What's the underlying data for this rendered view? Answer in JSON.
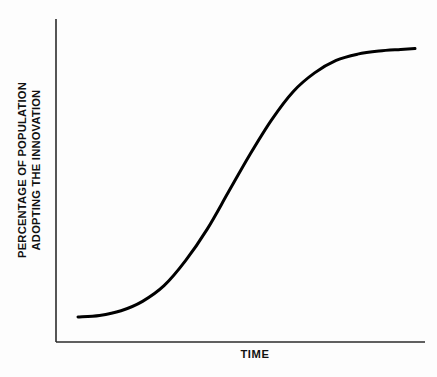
{
  "chart_data": {
    "type": "line",
    "title": "",
    "subtitle": "",
    "xlabel": "TIME",
    "ylabel_line1": "PERCENTAGE OF POPULATION",
    "ylabel_line2": "ADOPTING THE INNOVATION",
    "ylabel": "PERCENTAGE OF POPULATION ADOPTING THE INNOVATION",
    "grid": false,
    "legend": null,
    "legend_position": "none",
    "xlim": [
      0,
      100
    ],
    "ylim": [
      0,
      100
    ],
    "x_tick_labels": [],
    "y_tick_labels": [],
    "annotations": [],
    "series": [
      {
        "name": "Cumulative adoption (S-curve)",
        "color": "#000000",
        "line_width": 3,
        "x": [
          6,
          12,
          18,
          24,
          30,
          36,
          42,
          48,
          54,
          60,
          66,
          72,
          78,
          84,
          90,
          96,
          100
        ],
        "y": [
          8,
          8.5,
          10,
          13,
          18,
          26,
          36,
          48,
          60,
          71,
          80,
          86,
          90,
          92,
          93,
          93.5,
          93.8
        ]
      }
    ]
  },
  "axes": {
    "y_axis_color": "#2b2b2b",
    "x_axis_color": "#2b2b2b",
    "axis_line_width": 1.6
  },
  "canvas": {
    "background": "#fdfdfd",
    "width": 437,
    "height": 377
  }
}
